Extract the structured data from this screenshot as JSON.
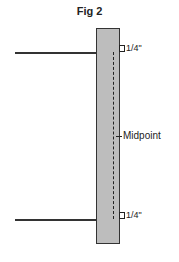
{
  "figure": {
    "title": "Fig 2",
    "labels": {
      "top_offset": "1/4\"",
      "midpoint": "Midpoint",
      "bottom_offset": "1/4\""
    },
    "colors": {
      "panel_fill": "#bdbdbd",
      "line": "#333333",
      "background": "#ffffff"
    }
  }
}
